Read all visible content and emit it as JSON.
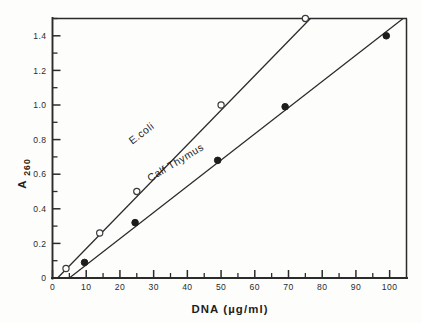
{
  "chart_data": {
    "type": "line",
    "title": "",
    "subtitle": "",
    "xlabel": "DNA (µg/ml)",
    "ylabel": "A260",
    "ylabel_base": "A",
    "ylabel_subscript": "260",
    "xlim": [
      0,
      105
    ],
    "ylim": [
      0,
      1.5
    ],
    "xticks": [
      0,
      10,
      20,
      30,
      40,
      50,
      60,
      70,
      80,
      90,
      100
    ],
    "xticklabels": [
      "0",
      "10",
      "20",
      "30",
      "40",
      "50",
      "60",
      "70",
      "80",
      "90",
      "100"
    ],
    "yticks": [
      0,
      0.2,
      0.4,
      0.6,
      0.8,
      1.0,
      1.2,
      1.4
    ],
    "yticklabels": [
      "0",
      "0.2",
      "0.4",
      "0.6",
      "0.8",
      "1.0",
      "1.2",
      "1.4"
    ],
    "y_minor_ticks": [
      0.1,
      0.3,
      0.5,
      0.7,
      0.9,
      1.1,
      1.3,
      1.5
    ],
    "x_minor_ticks": [
      5,
      15,
      25,
      35,
      45,
      55,
      65,
      75,
      85,
      95
    ],
    "grid": false,
    "legend_position": "inline-annotation",
    "frame": "box",
    "series": [
      {
        "name": "E.coli",
        "marker": "open-circle",
        "label_x": 27,
        "label_y": 0.82,
        "label_rotation": -37,
        "line_from": [
          1.5,
          0.0
        ],
        "line_to": [
          76.5,
          1.5
        ],
        "x": [
          4,
          14,
          25,
          50,
          75
        ],
        "y": [
          0.055,
          0.26,
          0.5,
          1.0,
          1.5
        ]
      },
      {
        "name": "Calf Thymus",
        "marker": "filled-circle",
        "label_x": 37,
        "label_y": 0.65,
        "label_rotation": -31,
        "line_from": [
          5.0,
          0.0
        ],
        "line_to": [
          104,
          1.5
        ],
        "x": [
          9.5,
          24.5,
          49,
          69,
          99
        ],
        "y": [
          0.09,
          0.32,
          0.68,
          0.99,
          1.4
        ]
      }
    ],
    "colors": {
      "axis": "#2b2b2b",
      "line": "#2b2b2b",
      "marker_open_fill": "#ffffff",
      "marker_filled_fill": "#1d1d1d",
      "background": "#fdfdfc"
    }
  }
}
